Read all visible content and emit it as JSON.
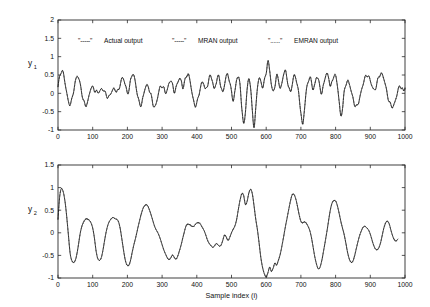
{
  "figure": {
    "background": "#ffffff",
    "foreground": "#111111"
  },
  "legend": {
    "position": "top-left-inside-upper-panel",
    "entries": [
      {
        "marker": "\"-----\"",
        "label": "Actual output",
        "style": "solid"
      },
      {
        "marker": "\"-----\"",
        "label": "MRAN output",
        "style": "dashed"
      },
      {
        "marker": "\"......\"",
        "label": "EMRAN output",
        "style": "dotted"
      }
    ]
  },
  "chart_data": [
    {
      "type": "line",
      "id": "panel-y1",
      "title": "",
      "xlabel": "",
      "ylabel": "y1",
      "ylabel_base": "y",
      "ylabel_sub": "1",
      "xlim": [
        0,
        1000
      ],
      "ylim": [
        -1,
        2
      ],
      "xticks": [
        0,
        100,
        200,
        300,
        400,
        500,
        600,
        700,
        800,
        900,
        1000
      ],
      "yticks": [
        -1,
        -0.5,
        0,
        0.5,
        1,
        1.5,
        2
      ],
      "ytick_labels": [
        "-1",
        "-0.5",
        "0",
        "0.5",
        "1",
        "1.5",
        "2"
      ],
      "grid": false,
      "legend": "inside upper-left",
      "series": [
        {
          "name": "Actual output",
          "style": "solid",
          "x": [
            0,
            5,
            10,
            15,
            20,
            25,
            30,
            35,
            40,
            45,
            50,
            55,
            60,
            65,
            70,
            75,
            80,
            85,
            90,
            95,
            100,
            105,
            110,
            115,
            120,
            125,
            130,
            135,
            140,
            145,
            150,
            155,
            160,
            165,
            170,
            175,
            180,
            185,
            190,
            195,
            200,
            205,
            210,
            215,
            220,
            225,
            230,
            235,
            240,
            245,
            250,
            255,
            260,
            265,
            270,
            275,
            280,
            285,
            290,
            295,
            300,
            305,
            310,
            315,
            320,
            325,
            330,
            335,
            340,
            345,
            350,
            355,
            360,
            365,
            370,
            375,
            380,
            385,
            390,
            395,
            400,
            405,
            410,
            415,
            420,
            425,
            430,
            435,
            440,
            445,
            450,
            455,
            460,
            465,
            470,
            475,
            480,
            485,
            490,
            495,
            500,
            505,
            510,
            515,
            520,
            525,
            530,
            535,
            540,
            545,
            550,
            555,
            560,
            565,
            570,
            575,
            580,
            585,
            590,
            595,
            600,
            605,
            610,
            615,
            620,
            625,
            630,
            635,
            640,
            645,
            650,
            655,
            660,
            665,
            670,
            675,
            680,
            685,
            690,
            695,
            700,
            705,
            710,
            715,
            720,
            725,
            730,
            735,
            740,
            745,
            750,
            755,
            760,
            765,
            770,
            775,
            780,
            785,
            790,
            795,
            800,
            805,
            810,
            815,
            820,
            825,
            830,
            835,
            840,
            845,
            850,
            855,
            860,
            865,
            870,
            875,
            880,
            885,
            890,
            895,
            900,
            905,
            910,
            915,
            920,
            925,
            930,
            935,
            940,
            945,
            950,
            955,
            960,
            965,
            970,
            975,
            980,
            985,
            990,
            995,
            1000
          ],
          "y": [
            0.18,
            0.45,
            0.62,
            0.55,
            0.3,
            0.02,
            -0.22,
            -0.3,
            -0.18,
            0.08,
            0.32,
            0.46,
            0.4,
            0.2,
            -0.05,
            -0.26,
            -0.33,
            -0.24,
            -0.04,
            0.14,
            0.16,
            0.1,
            0.05,
            0.02,
            0.06,
            0.12,
            0.1,
            0.02,
            -0.06,
            -0.1,
            -0.05,
            0.05,
            0.12,
            0.1,
            0.04,
            0.1,
            0.28,
            0.42,
            0.36,
            0.18,
            0.02,
            0.12,
            0.38,
            0.52,
            0.44,
            0.18,
            -0.1,
            -0.28,
            -0.3,
            -0.12,
            0.1,
            0.22,
            0.18,
            0.04,
            -0.14,
            -0.32,
            -0.36,
            -0.2,
            0.02,
            0.18,
            0.2,
            0.12,
            0.02,
            0.1,
            0.28,
            0.34,
            0.22,
            0.06,
            0.14,
            0.3,
            0.4,
            0.34,
            0.16,
            0.3,
            0.48,
            0.52,
            0.36,
            0.08,
            -0.18,
            -0.32,
            -0.28,
            -0.08,
            0.14,
            0.3,
            0.26,
            0.1,
            0.2,
            0.4,
            0.46,
            0.34,
            0.12,
            0.26,
            0.44,
            0.4,
            0.18,
            0.02,
            0.24,
            0.48,
            0.5,
            0.3,
            0.02,
            -0.18,
            0.06,
            0.38,
            0.44,
            0.18,
            -0.4,
            -0.86,
            -0.5,
            0.1,
            0.4,
            0.16,
            -0.5,
            -0.88,
            -0.42,
            0.18,
            0.42,
            0.3,
            0.18,
            0.34,
            0.58,
            0.88,
            0.62,
            0.24,
            0.04,
            0.22,
            0.46,
            0.38,
            0.14,
            0.26,
            0.52,
            0.6,
            0.42,
            0.16,
            0.04,
            0.24,
            0.48,
            0.44,
            0.18,
            -0.1,
            -0.52,
            -0.86,
            -0.46,
            0.02,
            0.3,
            0.42,
            0.32,
            0.12,
            0.24,
            0.44,
            0.38,
            0.16,
            0.02,
            0.2,
            0.44,
            0.54,
            0.42,
            0.2,
            0.3,
            0.5,
            0.46,
            0.22,
            -0.2,
            -0.62,
            -0.38,
            0.02,
            0.26,
            0.34,
            0.24,
            0.06,
            -0.14,
            -0.3,
            -0.36,
            -0.28,
            -0.1,
            0.1,
            0.28,
            0.42,
            0.5,
            0.46,
            0.34,
            0.2,
            0.1,
            0.14,
            0.3,
            0.46,
            0.54,
            0.5,
            0.36,
            0.16,
            -0.06,
            -0.24,
            -0.34,
            -0.36,
            -0.26,
            -0.1,
            0.08,
            0.2,
            0.16,
            0.06,
            0.14
          ]
        },
        {
          "name": "MRAN output",
          "style": "dashed",
          "note": "closely overlays actual output; visible divergence near i=110-135 and i=680-700"
        },
        {
          "name": "EMRAN output",
          "style": "dotted",
          "note": "closely overlays actual output; visible divergence near i=40-60 and i=790-810"
        }
      ]
    },
    {
      "type": "line",
      "id": "panel-y2",
      "title": "",
      "xlabel": "Sample index (i)",
      "ylabel": "y2",
      "ylabel_base": "y",
      "ylabel_sub": "2",
      "xlim": [
        0,
        1000
      ],
      "ylim": [
        -1,
        1.5
      ],
      "xticks": [
        0,
        100,
        200,
        300,
        400,
        500,
        600,
        700,
        800,
        900,
        1000
      ],
      "yticks": [
        -1,
        -0.5,
        0,
        0.5,
        1,
        1.5
      ],
      "ytick_labels": [
        "-1",
        "-0.5",
        "0",
        "0.5",
        "1",
        "1.5"
      ],
      "grid": false,
      "series": [
        {
          "name": "Actual output",
          "style": "solid",
          "x": [
            0,
            5,
            10,
            15,
            20,
            25,
            30,
            35,
            40,
            45,
            50,
            55,
            60,
            65,
            70,
            75,
            80,
            85,
            90,
            95,
            100,
            105,
            110,
            115,
            120,
            125,
            130,
            135,
            140,
            145,
            150,
            155,
            160,
            165,
            170,
            175,
            180,
            185,
            190,
            195,
            200,
            205,
            210,
            215,
            220,
            225,
            230,
            235,
            240,
            245,
            250,
            255,
            260,
            265,
            270,
            275,
            280,
            285,
            290,
            295,
            300,
            305,
            310,
            315,
            320,
            325,
            330,
            335,
            340,
            345,
            350,
            355,
            360,
            365,
            370,
            375,
            380,
            385,
            390,
            395,
            400,
            405,
            410,
            415,
            420,
            425,
            430,
            435,
            440,
            445,
            450,
            455,
            460,
            465,
            470,
            475,
            480,
            485,
            490,
            495,
            500,
            505,
            510,
            515,
            520,
            525,
            530,
            535,
            540,
            545,
            550,
            555,
            560,
            565,
            570,
            575,
            580,
            585,
            590,
            595,
            600,
            605,
            610,
            615,
            620,
            625,
            630,
            635,
            640,
            645,
            650,
            655,
            660,
            665,
            670,
            675,
            680,
            685,
            690,
            695,
            700,
            705,
            710,
            715,
            720,
            725,
            730,
            735,
            740,
            745,
            750,
            755,
            760,
            765,
            770,
            775,
            780,
            785,
            790,
            795,
            800,
            805,
            810,
            815,
            820,
            825,
            830,
            835,
            840,
            845,
            850,
            855,
            860,
            865,
            870,
            875,
            880,
            885,
            890,
            895,
            900,
            905,
            910,
            915,
            920,
            925,
            930,
            935,
            940,
            945,
            950,
            955,
            960,
            965,
            970,
            975,
            980,
            985,
            990,
            995,
            1000
          ],
          "y": [
            0.3,
            0.8,
            0.98,
            0.92,
            0.7,
            0.36,
            -0.05,
            -0.45,
            -0.62,
            -0.66,
            -0.6,
            -0.44,
            -0.22,
            0.02,
            0.18,
            0.26,
            0.3,
            0.3,
            0.28,
            0.22,
            0.1,
            -0.12,
            -0.4,
            -0.58,
            -0.62,
            -0.54,
            -0.36,
            -0.14,
            0.06,
            0.2,
            0.28,
            0.32,
            0.33,
            0.32,
            0.3,
            0.22,
            0.06,
            -0.18,
            -0.44,
            -0.64,
            -0.72,
            -0.7,
            -0.58,
            -0.4,
            -0.22,
            -0.06,
            0.1,
            0.26,
            0.42,
            0.54,
            0.6,
            0.62,
            0.58,
            0.48,
            0.34,
            0.22,
            0.12,
            0.04,
            -0.04,
            -0.14,
            -0.26,
            -0.38,
            -0.48,
            -0.55,
            -0.58,
            -0.56,
            -0.5,
            -0.54,
            -0.58,
            -0.52,
            -0.4,
            -0.26,
            -0.1,
            0.04,
            0.16,
            0.2,
            0.18,
            0.14,
            0.14,
            0.18,
            0.22,
            0.22,
            0.2,
            0.14,
            0.06,
            -0.04,
            -0.14,
            -0.22,
            -0.28,
            -0.32,
            -0.3,
            -0.24,
            -0.26,
            -0.3,
            -0.26,
            -0.16,
            -0.06,
            -0.1,
            -0.16,
            -0.1,
            0.0,
            0.08,
            0.16,
            0.3,
            0.52,
            0.74,
            0.88,
            0.82,
            0.62,
            0.7,
            0.88,
            0.96,
            0.86,
            0.6,
            0.3,
            0.04,
            -0.26,
            -0.56,
            -0.78,
            -0.92,
            -0.98,
            -0.88,
            -0.76,
            -0.86,
            -0.78,
            -0.66,
            -0.72,
            -0.62,
            -0.48,
            -0.3,
            -0.1,
            0.12,
            0.32,
            0.52,
            0.7,
            0.84,
            0.86,
            0.76,
            0.58,
            0.4,
            0.26,
            0.22,
            0.24,
            0.22,
            0.16,
            0.06,
            -0.1,
            -0.3,
            -0.52,
            -0.7,
            -0.8,
            -0.76,
            -0.62,
            -0.42,
            -0.2,
            0.04,
            0.28,
            0.5,
            0.66,
            0.72,
            0.7,
            0.6,
            0.44,
            0.26,
            0.1,
            -0.06,
            -0.24,
            -0.44,
            -0.6,
            -0.66,
            -0.62,
            -0.5,
            -0.34,
            -0.18,
            -0.04,
            0.06,
            0.12,
            0.14,
            0.12,
            0.06,
            -0.04,
            -0.16,
            -0.28,
            -0.36,
            -0.38,
            -0.32,
            -0.2,
            -0.04,
            0.12,
            0.24,
            0.26,
            0.18,
            0.04,
            -0.08,
            -0.16,
            -0.18,
            -0.14
          ]
        },
        {
          "name": "MRAN output",
          "style": "dashed",
          "note": "closely overlays actual output; small divergences near troughs at i=30-45, i=100-110, i=200-210, i=310-330, i=520-540, i=600-630, i=730-750, i=850-860"
        },
        {
          "name": "EMRAN output",
          "style": "dotted",
          "note": "closely overlays actual output"
        }
      ]
    }
  ]
}
